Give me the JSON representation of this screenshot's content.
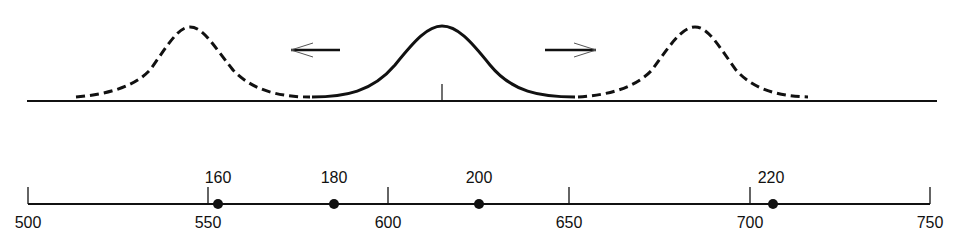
{
  "diagram": {
    "colors": {
      "ink": "#111111",
      "background": "#ffffff"
    },
    "top_panel": {
      "curves": [
        {
          "name": "left-shifted-distribution",
          "style": "dashed",
          "peak_x": 190
        },
        {
          "name": "central-distribution",
          "style": "solid",
          "peak_x": 442
        },
        {
          "name": "right-shifted-distribution",
          "style": "dashed",
          "peak_x": 695
        }
      ],
      "arrows": [
        {
          "name": "left-arrow",
          "direction": "left"
        },
        {
          "name": "right-arrow",
          "direction": "right"
        }
      ],
      "center_marker": "vertical tick at mean"
    },
    "scale": {
      "ticks": [
        {
          "label": "500"
        },
        {
          "label": "550"
        },
        {
          "label": "600"
        },
        {
          "label": "650"
        },
        {
          "label": "700"
        },
        {
          "label": "750"
        }
      ],
      "points": [
        {
          "label": "160",
          "position": 553
        },
        {
          "label": "180",
          "position": 585
        },
        {
          "label": "200",
          "position": 625
        },
        {
          "label": "220",
          "position": 707
        }
      ]
    }
  }
}
